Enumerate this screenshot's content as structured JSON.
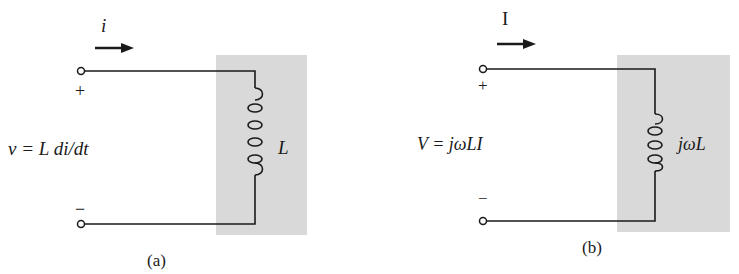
{
  "figure": {
    "panels": [
      {
        "id": "a",
        "caption": "(a)",
        "current_label": "i",
        "plus_sign": "+",
        "minus_sign": "−",
        "equation": "v = L di/dt",
        "component_label": "L",
        "component": "inductor",
        "domain": "time"
      },
      {
        "id": "b",
        "caption": "(b)",
        "current_label": "I",
        "plus_sign": "+",
        "minus_sign": "−",
        "equation": "V = jωLI",
        "component_label": "jωL",
        "component": "inductor",
        "domain": "phasor"
      }
    ],
    "colors": {
      "shade": "#d9d9d9",
      "wire": "#1a1a1a",
      "background": "#ffffff"
    }
  }
}
